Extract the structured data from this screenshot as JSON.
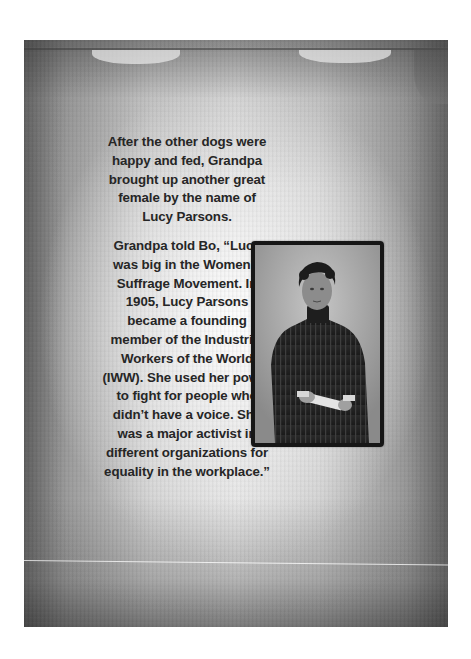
{
  "page": {
    "paragraphs": [
      "After the other dogs were happy and fed, Grandpa brought up another great female by the name of Lucy Parsons.",
      "Grandpa told Bo, “Lucy was big in the Women’s Suffrage Movement. In 1905, Lucy Parsons became a founding member of the Industrial Workers of the World (IWW). She used her power to fight for people who didn’t have a voice. She was a major activist in different organizations for equality in the workplace.”"
    ],
    "photo": {
      "subject": "Lucy Parsons",
      "alt": "Black-and-white portrait of Lucy Parsons in a dark striped high-collared dress, holding rolled papers",
      "frame_color": "#161616"
    },
    "colors": {
      "text": "#262626",
      "page_center": "#e3e3e3",
      "page_edge": "#5d5d5d"
    }
  }
}
